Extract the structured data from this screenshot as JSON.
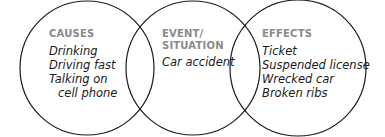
{
  "diagram": {
    "type": "cause-effect circles",
    "stroke_color": "#1a1a1a",
    "header_color": "#8a8a8a",
    "circles": [
      {
        "id": "causes",
        "heading": [
          "CAUSES"
        ],
        "items": [
          "Drinking",
          "Driving fast",
          "Talking on",
          "cell phone"
        ]
      },
      {
        "id": "event",
        "heading": [
          "EVENT/",
          "SITUATION"
        ],
        "items": [
          "Car accident"
        ]
      },
      {
        "id": "effects",
        "heading": [
          "EFFECTS"
        ],
        "items": [
          "Ticket",
          "Suspended license",
          "Wrecked car",
          "Broken ribs"
        ]
      }
    ]
  }
}
